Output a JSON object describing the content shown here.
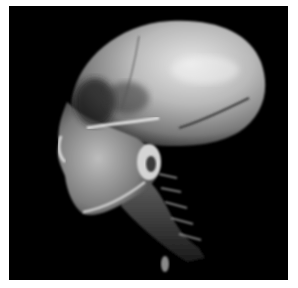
{
  "image": {
    "subject": "3D CT volume rendering of a human skull and cervical spine, lateral (left-facing) view",
    "background_color": "#000000",
    "border_color": "#ffffff",
    "tone": "grayscale"
  }
}
